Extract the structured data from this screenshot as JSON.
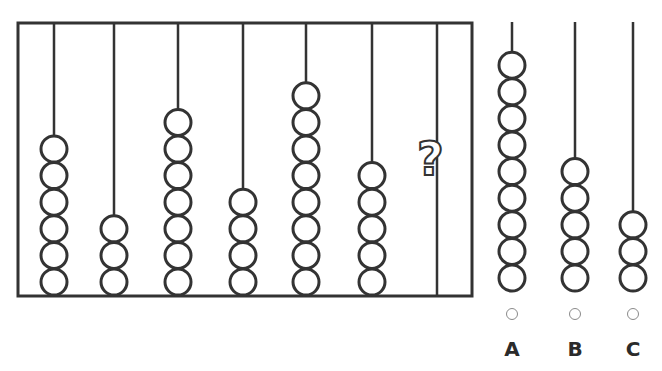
{
  "puzzle": {
    "question_mark": "?",
    "frame": {
      "x": 18,
      "y": 23,
      "width": 454,
      "height": 273
    },
    "stroke_color": "#333333",
    "rods": [
      {
        "x": 54,
        "beads": 6
      },
      {
        "x": 114,
        "beads": 3
      },
      {
        "x": 178,
        "beads": 7
      },
      {
        "x": 243,
        "beads": 4
      },
      {
        "x": 306,
        "beads": 8
      },
      {
        "x": 372,
        "beads": 5
      },
      {
        "x": 437,
        "beads": null,
        "unknown": true
      }
    ]
  },
  "options": [
    {
      "label": "A",
      "x": 512,
      "beads": 9
    },
    {
      "label": "B",
      "x": 575,
      "beads": 5
    },
    {
      "label": "C",
      "x": 633,
      "beads": 3
    }
  ]
}
